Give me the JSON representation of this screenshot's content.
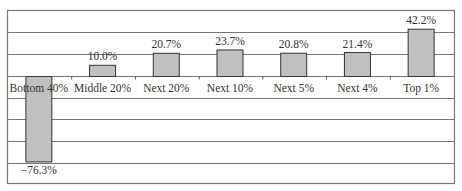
{
  "chart_data": {
    "type": "bar",
    "title": "",
    "xlabel": "",
    "ylabel": "",
    "categories": [
      "Bottom 40%",
      "Middle 20%",
      "Next 20%",
      "Next 10%",
      "Next 5%",
      "Next 4%",
      "Top 1%"
    ],
    "values": [
      -76.3,
      10.0,
      20.7,
      23.7,
      20.8,
      21.4,
      42.2
    ],
    "value_labels": [
      "−76.3%",
      "10.0%",
      "20.7%",
      "23.7%",
      "20.8%",
      "21.4%",
      "42.2%"
    ],
    "ylim": [
      -96,
      58
    ],
    "gridline_step": 19,
    "grid": true,
    "legend": null,
    "bar_color": "#c0c0c0",
    "bar_edge_color": "#333333",
    "grid_color": "#777777",
    "axis_labels_at_zero": true
  }
}
